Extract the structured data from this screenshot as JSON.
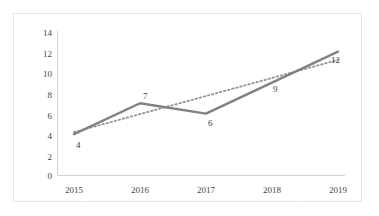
{
  "chart_data": {
    "type": "line",
    "title": "",
    "subtitle": "",
    "xlabel": "",
    "ylabel": "",
    "categories": [
      "2015",
      "2016",
      "2017",
      "2018",
      "2019"
    ],
    "series": [
      {
        "name": "series-1",
        "style": "solid",
        "color": "#808086",
        "values": [
          4,
          7,
          6,
          9,
          12
        ],
        "data_labels": [
          "4",
          "7",
          "6",
          "9",
          "12"
        ]
      },
      {
        "name": "trendline",
        "style": "dotted",
        "color": "#93939a",
        "values": [
          4.2,
          5.95,
          7.7,
          9.45,
          11.2
        ],
        "data_labels": []
      }
    ],
    "yticks": [
      "0",
      "2",
      "4",
      "6",
      "8",
      "10",
      "12",
      "14"
    ],
    "ylim": [
      0,
      14
    ],
    "xticks": [
      "2015",
      "2016",
      "2017",
      "2018",
      "2019"
    ],
    "grid": false,
    "legend": false,
    "legend_position": "none",
    "plot_background": "#ffffff",
    "frame_color": "#e3e3e6",
    "axis_color": "#d4d4d8"
  }
}
